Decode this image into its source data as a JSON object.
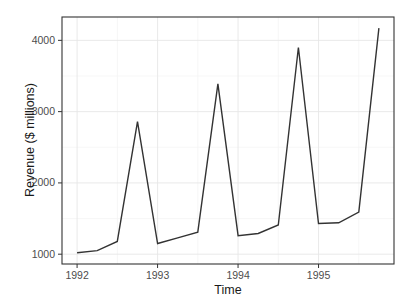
{
  "figure": {
    "background": "#ffffff"
  },
  "chart_data": {
    "type": "line",
    "xlabel": "Time",
    "ylabel": "Revenue ($ millions)",
    "x": [
      1992.0,
      1992.25,
      1992.5,
      1992.75,
      1993.0,
      1993.25,
      1993.5,
      1993.75,
      1994.0,
      1994.25,
      1994.5,
      1994.75,
      1995.0,
      1995.25,
      1995.5,
      1995.75
    ],
    "values": [
      1020,
      1050,
      1180,
      2860,
      1150,
      1230,
      1310,
      3390,
      1260,
      1290,
      1410,
      3900,
      1430,
      1440,
      1590,
      4170
    ],
    "xlim": [
      1991.8125,
      1995.9375
    ],
    "ylim": [
      862.5,
      4327.5
    ],
    "x_major_ticks": [
      1992,
      1993,
      1994,
      1995
    ],
    "x_tick_labels": [
      "1992",
      "1993",
      "1994",
      "1995"
    ],
    "x_minor_gridlines": [
      1992.5,
      1993.5,
      1994.5,
      1995.5
    ],
    "y_major_ticks": [
      1000,
      2000,
      3000,
      4000
    ],
    "y_tick_labels": [
      "1000",
      "2000",
      "3000",
      "4000"
    ],
    "y_minor_gridlines": [
      1500,
      2500,
      3500
    ],
    "grid": "on",
    "legend": "none",
    "colors": {
      "line": "#333333",
      "panel_border": "#333333",
      "major_grid": "#e6e6e6",
      "minor_grid": "#f2f2f2",
      "tick_mark": "#333333",
      "axis_text": "#4d4d4d",
      "axis_title": "#1a1a1a",
      "panel_background": "#ffffff"
    }
  }
}
